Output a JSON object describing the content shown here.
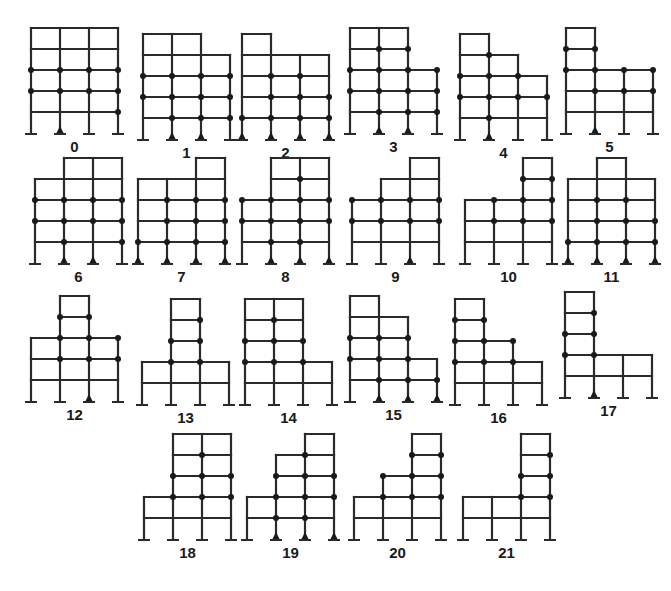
{
  "figure": {
    "frames": [
      {
        "label": "0",
        "bays": [
          5,
          5,
          5
        ],
        "supports": [
          "fixed",
          "pinned",
          "fixed",
          "fixed"
        ],
        "hinges": [
          [
            0,
            3
          ],
          [
            1,
            3
          ],
          [
            2,
            3
          ],
          [
            3,
            3
          ],
          [
            0,
            2
          ],
          [
            1,
            2
          ],
          [
            2,
            2
          ],
          [
            3,
            2
          ],
          [
            3,
            1
          ]
        ]
      },
      {
        "label": "1",
        "bays": [
          5,
          5,
          4
        ],
        "supports": [
          "fixed",
          "pinned",
          "pinned",
          "fixed"
        ],
        "hinges": [
          [
            0,
            3
          ],
          [
            1,
            3
          ],
          [
            2,
            3
          ],
          [
            3,
            3
          ],
          [
            0,
            2
          ],
          [
            1,
            2
          ],
          [
            2,
            2
          ],
          [
            3,
            2
          ],
          [
            1,
            1
          ],
          [
            2,
            1
          ],
          [
            3,
            1
          ]
        ]
      },
      {
        "label": "2",
        "bays": [
          5,
          4,
          4
        ],
        "supports": [
          "pinned",
          "pinned",
          "pinned",
          "pinned"
        ],
        "hinges": [
          [
            1,
            3
          ],
          [
            2,
            3
          ],
          [
            1,
            2
          ],
          [
            2,
            2
          ],
          [
            3,
            2
          ],
          [
            0,
            1
          ],
          [
            1,
            1
          ],
          [
            2,
            1
          ],
          [
            3,
            1
          ]
        ]
      },
      {
        "label": "3",
        "bays": [
          5,
          5,
          3
        ],
        "supports": [
          "fixed",
          "pinned",
          "pinned",
          "fixed"
        ],
        "hinges": [
          [
            1,
            4
          ],
          [
            2,
            4
          ],
          [
            0,
            3
          ],
          [
            1,
            3
          ],
          [
            2,
            3
          ],
          [
            3,
            3
          ],
          [
            0,
            2
          ],
          [
            1,
            2
          ],
          [
            2,
            2
          ],
          [
            3,
            2
          ],
          [
            1,
            1
          ],
          [
            2,
            1
          ],
          [
            3,
            1
          ]
        ]
      },
      {
        "label": "4",
        "bays": [
          5,
          4,
          3
        ],
        "supports": [
          "fixed",
          "pinned",
          "fixed",
          "fixed"
        ],
        "hinges": [
          [
            1,
            4
          ],
          [
            0,
            3
          ],
          [
            1,
            3
          ],
          [
            2,
            3
          ],
          [
            0,
            2
          ],
          [
            1,
            2
          ],
          [
            2,
            2
          ],
          [
            3,
            2
          ],
          [
            1,
            1
          ]
        ]
      },
      {
        "label": "5",
        "bays": [
          5,
          3,
          3
        ],
        "supports": [
          "fixed",
          "pinned",
          "fixed",
          "fixed"
        ],
        "hinges": [
          [
            0,
            4
          ],
          [
            1,
            4
          ],
          [
            0,
            3
          ],
          [
            1,
            3
          ],
          [
            2,
            3
          ],
          [
            3,
            3
          ],
          [
            1,
            2
          ],
          [
            2,
            2
          ],
          [
            3,
            2
          ]
        ]
      },
      {
        "label": "6",
        "bays": [
          4,
          5,
          5
        ],
        "supports": [
          "fixed",
          "pinned",
          "pinned",
          "fixed"
        ],
        "hinges": [
          [
            0,
            3
          ],
          [
            1,
            3
          ],
          [
            2,
            3
          ],
          [
            3,
            3
          ],
          [
            0,
            2
          ],
          [
            1,
            2
          ],
          [
            2,
            2
          ],
          [
            3,
            2
          ],
          [
            1,
            1
          ],
          [
            3,
            1
          ]
        ]
      },
      {
        "label": "7",
        "bays": [
          4,
          4,
          5
        ],
        "supports": [
          "pinned",
          "pinned",
          "pinned",
          "pinned"
        ],
        "hinges": [
          [
            1,
            3
          ],
          [
            2,
            3
          ],
          [
            3,
            3
          ],
          [
            1,
            2
          ],
          [
            2,
            2
          ],
          [
            3,
            2
          ],
          [
            0,
            1
          ],
          [
            1,
            1
          ],
          [
            2,
            1
          ],
          [
            3,
            1
          ]
        ]
      },
      {
        "label": "8",
        "bays": [
          3,
          5,
          5
        ],
        "supports": [
          "fixed",
          "pinned",
          "pinned",
          "pinned"
        ],
        "hinges": [
          [
            2,
            4
          ],
          [
            0,
            3
          ],
          [
            1,
            3
          ],
          [
            2,
            3
          ],
          [
            3,
            3
          ],
          [
            0,
            2
          ],
          [
            1,
            2
          ],
          [
            2,
            2
          ],
          [
            3,
            2
          ],
          [
            1,
            1
          ],
          [
            2,
            1
          ]
        ]
      },
      {
        "label": "9",
        "bays": [
          3,
          4,
          5
        ],
        "supports": [
          "fixed",
          "fixed",
          "pinned",
          "fixed"
        ],
        "hinges": [
          [
            0,
            3
          ],
          [
            1,
            3
          ],
          [
            2,
            3
          ],
          [
            3,
            3
          ],
          [
            0,
            2
          ],
          [
            1,
            2
          ],
          [
            2,
            2
          ],
          [
            3,
            2
          ]
        ]
      },
      {
        "label": "10",
        "bays": [
          3,
          3,
          5
        ],
        "supports": [
          "fixed",
          "fixed",
          "fixed",
          "fixed"
        ],
        "hinges": [
          [
            2,
            4
          ],
          [
            3,
            4
          ],
          [
            1,
            3
          ],
          [
            2,
            3
          ],
          [
            3,
            3
          ],
          [
            1,
            2
          ],
          [
            2,
            2
          ],
          [
            3,
            2
          ]
        ]
      },
      {
        "label": "11",
        "bays": [
          4,
          5,
          4
        ],
        "supports": [
          "pinned",
          "pinned",
          "pinned",
          "pinned"
        ],
        "hinges": [
          [
            1,
            3
          ],
          [
            2,
            3
          ],
          [
            1,
            2
          ],
          [
            2,
            2
          ],
          [
            3,
            2
          ],
          [
            0,
            1
          ],
          [
            1,
            1
          ],
          [
            2,
            1
          ],
          [
            3,
            1
          ]
        ]
      },
      {
        "label": "12",
        "bays": [
          3,
          5,
          3
        ],
        "supports": [
          "fixed",
          "fixed",
          "pinned",
          "fixed"
        ],
        "hinges": [
          [
            1,
            4
          ],
          [
            2,
            4
          ],
          [
            1,
            3
          ],
          [
            2,
            3
          ],
          [
            3,
            3
          ],
          [
            1,
            2
          ],
          [
            2,
            2
          ],
          [
            3,
            2
          ]
        ]
      },
      {
        "label": "13",
        "bays": [
          2,
          5,
          2
        ],
        "supports": [
          "fixed",
          "fixed",
          "fixed",
          "fixed"
        ],
        "hinges": [
          [
            2,
            4
          ],
          [
            1,
            3
          ],
          [
            2,
            3
          ],
          [
            1,
            2
          ],
          [
            2,
            2
          ]
        ]
      },
      {
        "label": "14",
        "bays": [
          5,
          5,
          2
        ],
        "supports": [
          "fixed",
          "fixed",
          "fixed",
          "fixed"
        ],
        "hinges": [
          [
            1,
            4
          ],
          [
            0,
            3
          ],
          [
            1,
            3
          ],
          [
            2,
            3
          ],
          [
            0,
            2
          ],
          [
            1,
            2
          ],
          [
            2,
            2
          ]
        ]
      },
      {
        "label": "15",
        "bays": [
          5,
          4,
          2
        ],
        "supports": [
          "fixed",
          "pinned",
          "pinned",
          "pinned"
        ],
        "hinges": [
          [
            0,
            3
          ],
          [
            1,
            3
          ],
          [
            2,
            3
          ],
          [
            0,
            2
          ],
          [
            1,
            2
          ],
          [
            2,
            2
          ],
          [
            1,
            1
          ],
          [
            2,
            1
          ],
          [
            3,
            1
          ]
        ]
      },
      {
        "label": "16",
        "bays": [
          5,
          3,
          2
        ],
        "supports": [
          "fixed",
          "fixed",
          "fixed",
          "fixed"
        ],
        "hinges": [
          [
            0,
            4
          ],
          [
            1,
            4
          ],
          [
            0,
            3
          ],
          [
            1,
            3
          ],
          [
            2,
            3
          ],
          [
            0,
            2
          ],
          [
            1,
            2
          ],
          [
            2,
            2
          ]
        ]
      },
      {
        "label": "17",
        "bays": [
          5,
          2,
          2
        ],
        "supports": [
          "fixed",
          "pinned",
          "fixed",
          "fixed"
        ],
        "hinges": [
          [
            1,
            4
          ],
          [
            0,
            3
          ],
          [
            1,
            3
          ],
          [
            0,
            2
          ],
          [
            1,
            2
          ]
        ]
      },
      {
        "label": "18",
        "bays": [
          2,
          5,
          5
        ],
        "supports": [
          "fixed",
          "fixed",
          "fixed",
          "fixed"
        ],
        "hinges": [
          [
            2,
            4
          ],
          [
            1,
            3
          ],
          [
            2,
            3
          ],
          [
            3,
            3
          ],
          [
            1,
            2
          ],
          [
            2,
            2
          ],
          [
            3,
            2
          ]
        ]
      },
      {
        "label": "19",
        "bays": [
          2,
          4,
          5
        ],
        "supports": [
          "fixed",
          "pinned",
          "pinned",
          "pinned"
        ],
        "hinges": [
          [
            2,
            4
          ],
          [
            1,
            3
          ],
          [
            2,
            3
          ],
          [
            3,
            3
          ],
          [
            1,
            2
          ],
          [
            2,
            2
          ],
          [
            3,
            2
          ],
          [
            1,
            1
          ],
          [
            2,
            1
          ]
        ]
      },
      {
        "label": "20",
        "bays": [
          2,
          3,
          5
        ],
        "supports": [
          "fixed",
          "fixed",
          "fixed",
          "fixed"
        ],
        "hinges": [
          [
            2,
            4
          ],
          [
            3,
            4
          ],
          [
            1,
            3
          ],
          [
            2,
            3
          ],
          [
            3,
            3
          ],
          [
            1,
            2
          ],
          [
            2,
            2
          ],
          [
            3,
            2
          ]
        ]
      },
      {
        "label": "21",
        "bays": [
          2,
          2,
          5
        ],
        "supports": [
          "fixed",
          "fixed",
          "fixed",
          "fixed"
        ],
        "hinges": [
          [
            3,
            4
          ],
          [
            2,
            3
          ],
          [
            3,
            3
          ],
          [
            2,
            2
          ],
          [
            3,
            2
          ]
        ]
      }
    ]
  }
}
